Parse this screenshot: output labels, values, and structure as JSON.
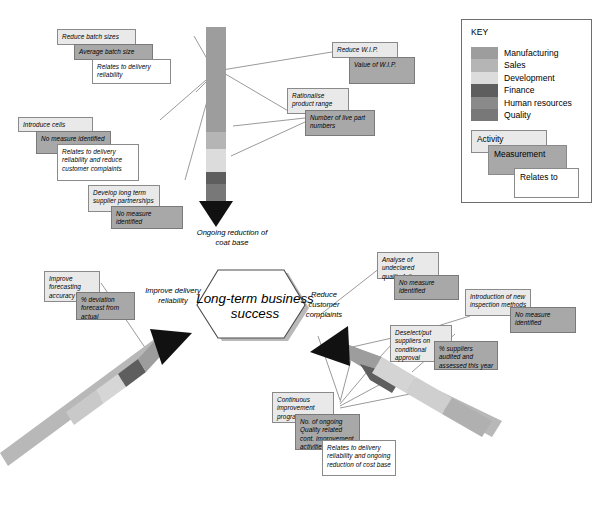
{
  "key_panel": {
    "title": "KEY",
    "swatches": [
      {
        "label": "Manufacturing",
        "color": "#9d9d9d"
      },
      {
        "label": "Sales",
        "color": "#b5b5b5"
      },
      {
        "label": "Development",
        "color": "#dcdcdc"
      },
      {
        "label": "Finance",
        "color": "#5e5e5e"
      },
      {
        "label": "Human resources",
        "color": "#8a8a8a"
      },
      {
        "label": "Quality",
        "color": "#787878"
      }
    ],
    "shapes": [
      {
        "label": "Activity",
        "kind": "activity"
      },
      {
        "label": "Measurement",
        "kind": "measure"
      },
      {
        "label": "Relates to",
        "kind": "relates"
      }
    ]
  },
  "center": {
    "label": "Long-term business success"
  },
  "arrow_labels": {
    "top": "Ongoing reduction of coat base",
    "left": "Improve delivery reliability",
    "right": "Reduce customer complaints"
  },
  "boxes": {
    "reduce_batch_activity": "Reduce batch sizes",
    "reduce_batch_measure": "Average batch size",
    "reduce_batch_relates": "Relates to delivery reliability",
    "introduce_cells_activity": "Introduce cells",
    "introduce_cells_measure": "No measure identified",
    "introduce_cells_relates": "Relates to delivery reliability and reduce customer complaints",
    "supplier_activity": "Develop long term supplier partnerships",
    "supplier_measure": "No measure identified",
    "wip_activity": "Reduce W.I.P.",
    "wip_measure": "Value of W.I.P.",
    "rationalise_activity": "Rationalise product range",
    "rationalise_measure": "Number of live part numbers",
    "forecast_activity": "Improve forecasting accuracy",
    "forecast_measure": "% deviation forecast from actual",
    "quality_failures_activity": "Analyse of undeclared quality failures",
    "quality_failures_measure": "No measure identified",
    "inspection_activity": "Introduction of new inspection methods",
    "inspection_measure": "No measure identified",
    "deselect_activity": "Deselect/put suppliers on conditional approval",
    "deselect_measure": "% suppliers audited and assessed this year",
    "cip_activity": "Continuous improvement programme",
    "cip_measure": "No. of ongoing Quality related cont. improvement activities",
    "cip_relates": "Relates to delivery reliability and ongoing reduction of cost base"
  },
  "palette": {
    "manufacturing": "#9d9d9d",
    "sales": "#b5b5b5",
    "development": "#dcdcdc",
    "finance": "#5e5e5e",
    "human_resources": "#8a8a8a",
    "quality": "#787878",
    "arrowhead": "#111111",
    "activity_fill": "#e9e9e9",
    "measure_fill": "#a8a8a8",
    "relates_fill": "#ffffff"
  }
}
